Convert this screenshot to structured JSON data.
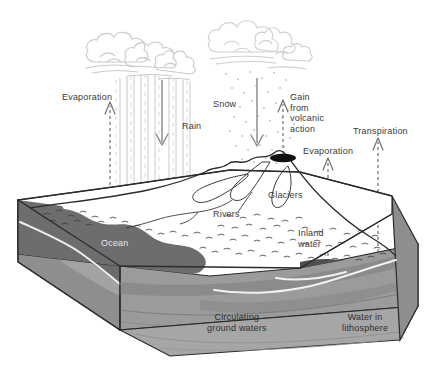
{
  "diagram": {
    "type": "hydrologic-cycle-block-diagram",
    "palette": {
      "background": "#ffffff",
      "outline": "#2b2b2b",
      "cloud_stroke": "#c9c9c9",
      "rain_stroke": "#bcbcbc",
      "snow_dot": "#c4c4c4",
      "arrow_solid": "#8c8c8c",
      "arrow_dashed": "#6e6e6e",
      "ocean": "#6d6d6d",
      "ocean_side": "#5f5f5f",
      "land_top": "#ffffff",
      "rock_light": "#a0a0a0",
      "rock_mid": "#949494",
      "rock_dark": "#868686",
      "block_left_face": "#8e8e8e",
      "block_front_face": "#9b9b9b",
      "volcano_crater": "#111111",
      "label_text": "#3a3a3a",
      "label_on_water": "#e8e8e8"
    },
    "labels": [
      {
        "id": "evaporation-ocean",
        "text": "Evaporation",
        "x": 62,
        "y": 92,
        "align": "left"
      },
      {
        "id": "rain",
        "text": "Rain",
        "x": 182,
        "y": 121,
        "align": "left"
      },
      {
        "id": "snow",
        "text": "Snow",
        "x": 213,
        "y": 99,
        "align": "left"
      },
      {
        "id": "gain-volcanic",
        "text": "Gain\nfrom\nvolcanic\naction",
        "x": 290,
        "y": 92,
        "align": "left"
      },
      {
        "id": "evaporation-inland",
        "text": "Evaporation",
        "x": 303,
        "y": 146,
        "align": "left"
      },
      {
        "id": "transpiration",
        "text": "Transpiration",
        "x": 353,
        "y": 126,
        "align": "left"
      },
      {
        "id": "glaciers",
        "text": "Glaciers",
        "x": 268,
        "y": 190,
        "align": "left"
      },
      {
        "id": "rivers",
        "text": "Rivers",
        "x": 213,
        "y": 209,
        "align": "left"
      },
      {
        "id": "ocean",
        "text": "Ocean",
        "x": 101,
        "y": 238,
        "align": "left"
      },
      {
        "id": "inland-water",
        "text": "Inland\nwater",
        "x": 298,
        "y": 228,
        "align": "left"
      },
      {
        "id": "circulating-ground-waters",
        "text": "Circulating\nground waters",
        "x": 207,
        "y": 312,
        "align": "left"
      },
      {
        "id": "water-in-lithosphere",
        "text": "Water in\nlithosphere",
        "x": 342,
        "y": 312,
        "align": "left"
      }
    ],
    "features": [
      {
        "id": "rain-cloud",
        "name": "Cumulus rain cloud",
        "precipitation": "rain streaks"
      },
      {
        "id": "snow-cloud",
        "name": "Cumulus snow cloud",
        "precipitation": "snow dots"
      },
      {
        "id": "volcano",
        "name": "Volcano with crater",
        "emits": "Gain from volcanic action"
      },
      {
        "id": "glacier",
        "name": "Glacier tongues"
      },
      {
        "id": "river",
        "name": "Rivers"
      },
      {
        "id": "ocean-body",
        "name": "Ocean"
      },
      {
        "id": "inland-lake",
        "name": "Inland water"
      },
      {
        "id": "ground-water",
        "name": "Circulating ground waters"
      },
      {
        "id": "lithosphere",
        "name": "Water in lithosphere"
      }
    ],
    "arrows": [
      {
        "id": "arrow-evaporation-ocean",
        "style": "dashed",
        "direction": "up",
        "x": 110
      },
      {
        "id": "arrow-rain",
        "style": "solid",
        "direction": "down",
        "x": 162
      },
      {
        "id": "arrow-snow",
        "style": "solid",
        "direction": "down",
        "x": 257
      },
      {
        "id": "arrow-volcanic",
        "style": "dashed",
        "direction": "up",
        "x": 283
      },
      {
        "id": "arrow-evaporation-inland",
        "style": "dashed",
        "direction": "up",
        "x": 328
      },
      {
        "id": "arrow-transpiration",
        "style": "dashed",
        "direction": "up",
        "x": 378
      }
    ]
  }
}
